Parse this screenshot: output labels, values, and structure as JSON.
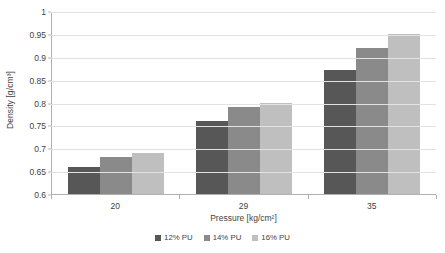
{
  "chart_data": {
    "type": "bar",
    "title": "",
    "xlabel": "Pressure [kg/cm²]",
    "ylabel": "Density [g/cm³]",
    "categories": [
      "20",
      "29",
      "35"
    ],
    "series": [
      {
        "name": "12% PU",
        "values": [
          0.66,
          0.76,
          0.87
        ],
        "color": "#575757"
      },
      {
        "name": "14% PU",
        "values": [
          0.68,
          0.79,
          0.92
        ],
        "color": "#8a8a8a"
      },
      {
        "name": "16% PU",
        "values": [
          0.69,
          0.8,
          0.95
        ],
        "color": "#bfbfbf"
      }
    ],
    "ylim": [
      0.6,
      1
    ],
    "ytick_values": [
      0.6,
      0.65,
      0.7,
      0.75,
      0.8,
      0.85,
      0.9,
      0.95,
      1
    ],
    "ytick_labels": [
      "0.6",
      "0.65",
      "0.7",
      "0.75",
      "0.8",
      "0.85",
      "0.9",
      "0.95",
      "1"
    ],
    "grid": "horizontal",
    "legend_position": "bottom"
  },
  "colors": {
    "series_12pu": "#575757",
    "series_14pu": "#8a8a8a",
    "series_16pu": "#bfbfbf",
    "gridline": "#e2e2e2",
    "axis": "#b0b0b0",
    "text": "#3f3f3f",
    "background": "#ffffff"
  }
}
